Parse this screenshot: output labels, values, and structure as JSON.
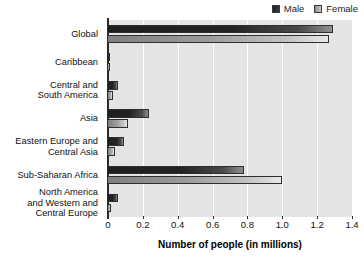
{
  "chart_data": {
    "type": "bar",
    "orientation": "horizontal",
    "title": "",
    "xlabel": "Number of people (in millions)",
    "ylabel": "",
    "xlim": [
      0,
      1.4
    ],
    "xticks": [
      "0",
      "0.2",
      "0.4",
      "0.6",
      "0.8",
      "1.0",
      "1.2",
      "1.4"
    ],
    "xtick_values": [
      0,
      0.2,
      0.4,
      0.6,
      0.8,
      1.0,
      1.2,
      1.4
    ],
    "grid": "vertical",
    "legend_position": "top-right",
    "categories": [
      "Global",
      "Caribbean",
      "Central and\nSouth America",
      "Asia",
      "Eastern Europe and\nCentral Asia",
      "Sub-Saharan Africa",
      "North America\nand Western and\nCentral Europe"
    ],
    "series": [
      {
        "name": "Male",
        "color": "#1e1e1e",
        "values": [
          1.29,
          0.01,
          0.06,
          0.235,
          0.09,
          0.78,
          0.06
        ]
      },
      {
        "name": "Female",
        "color": "#9b9b9b",
        "values": [
          1.27,
          0.01,
          0.03,
          0.115,
          0.04,
          1.0,
          0.02
        ]
      }
    ]
  },
  "legend": {
    "items": [
      {
        "label": "Male",
        "swatch": "male"
      },
      {
        "label": "Female",
        "swatch": "female"
      }
    ]
  },
  "axis": {
    "xlabel": "Number of people (in millions)"
  },
  "colors": {
    "plot_background": "#e4e4e4",
    "gridline": "#ffffff",
    "axis": "#2b2b2b",
    "male": "#1e1e1e",
    "female": "#9b9b9b"
  }
}
